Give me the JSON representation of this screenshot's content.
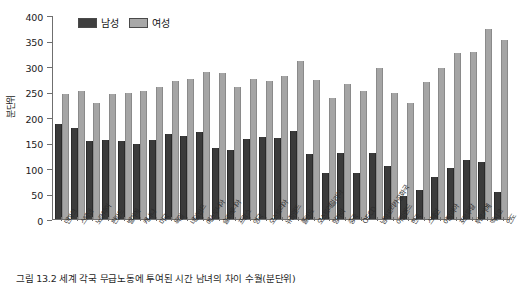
{
  "chart_data": {
    "type": "bar",
    "title": "",
    "xlabel": "",
    "ylabel": "분단위",
    "ylim": [
      0,
      400
    ],
    "yticks": [
      0,
      50,
      100,
      150,
      200,
      250,
      300,
      350,
      400
    ],
    "grid": false,
    "legend_position": "top-left",
    "categories": [
      "덴마크",
      "스웨덴",
      "노르웨이",
      "핀란드",
      "벨기에",
      "캐나다",
      "미국",
      "독일",
      "네덜란드",
      "에스토니아",
      "슬로베니아",
      "프랑스",
      "영국",
      "오스트리아",
      "뉴질랜드",
      "폴란드",
      "오스트레일리아",
      "헝가리",
      "중국",
      "OECD",
      "남아프리카공화국",
      "아일랜드",
      "한국",
      "스페인",
      "이탈리아",
      "포르투갈",
      "튀르키예",
      "멕시코",
      "인도"
    ],
    "series": [
      {
        "name": "남성",
        "color": "#3b3b3b",
        "values": [
          186,
          178,
          153,
          155,
          153,
          148,
          155,
          166,
          163,
          170,
          140,
          135,
          157,
          160,
          159,
          172,
          127,
          91,
          130,
          91,
          130,
          103,
          45,
          56,
          83,
          100,
          116,
          112,
          52
        ]
      },
      {
        "name": "여성",
        "color": "#a5a5a5",
        "values": [
          245,
          251,
          228,
          246,
          247,
          251,
          258,
          271,
          275,
          289,
          287,
          259,
          275,
          270,
          281,
          310,
          272,
          238,
          264,
          251,
          296,
          247,
          228,
          268,
          296,
          325,
          328,
          373,
          351
        ]
      }
    ],
    "legend": [
      "남성",
      "여성"
    ]
  },
  "caption": {
    "text": "그림 13.2 세계 각국 무급노동에 투여된 시간 남녀의 차이 수월(분단위)"
  }
}
